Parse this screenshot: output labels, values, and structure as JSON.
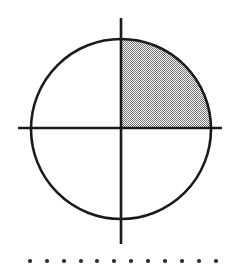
{
  "figure": {
    "kind": "geometry-diagram",
    "canvas": {
      "width": 235,
      "height": 278,
      "background_color": "#ffffff"
    },
    "circle": {
      "name": "circle",
      "center_x": 121,
      "center_y": 129,
      "radius": 90,
      "stroke_color": "#1a1a1a",
      "stroke_width": 2.6,
      "fill_color": "none"
    },
    "vertical_axis": {
      "name": "vertical-axis",
      "x": 121,
      "y_start": 18,
      "y_end": 244,
      "stroke_color": "#1a1a1a",
      "stroke_width": 2.6
    },
    "horizontal_axis": {
      "name": "horizontal-axis",
      "y": 128,
      "x_start": 18,
      "x_end": 222,
      "stroke_color": "#1a1a1a",
      "stroke_width": 2.6
    },
    "shaded_quadrant": {
      "name": "upper-right-quadrant",
      "label": "Quadrant I",
      "position": "upper-right",
      "fill_color": "#a6a6a6",
      "fill_style": "checkerboard-dither",
      "dither_light": "#ffffff",
      "dither_dark": "#6e6e6e",
      "dither_cell_px": 1
    },
    "dot_row": {
      "name": "dot-row",
      "count": 12,
      "y": 261,
      "x_start": 30,
      "x_spacing": 16.9,
      "dot_radius": 2.1,
      "dot_color": "#2b2b2b",
      "dots_x": [
        30,
        47,
        64,
        81,
        97,
        114,
        131,
        148,
        165,
        182,
        199,
        216
      ]
    }
  }
}
